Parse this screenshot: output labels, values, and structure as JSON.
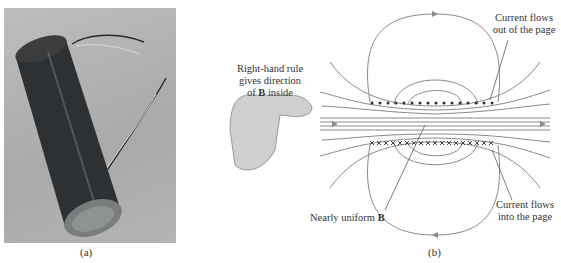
{
  "panel_a": {
    "caption": "(a)",
    "subject": "solenoid-photo"
  },
  "panel_b": {
    "caption": "(b)",
    "hand_label_line1": "Right-hand rule",
    "hand_label_line2": "gives direction",
    "hand_label_line3_prefix": "of ",
    "hand_label_vector": "B",
    "hand_label_line3_suffix": " inside",
    "top_label_line1": "Current flows",
    "top_label_line2": "out of the page",
    "bottom_label_line1": "Current flows",
    "bottom_label_line2": "into the page",
    "uniform_label_prefix": "Nearly uniform ",
    "uniform_label_vector": "B"
  },
  "colors": {
    "field_line": "#8a8a8a",
    "text": "#333333",
    "photo_bg": "#b0b0b0",
    "coil": "#2e3133",
    "hand": "#c9c9c9"
  }
}
